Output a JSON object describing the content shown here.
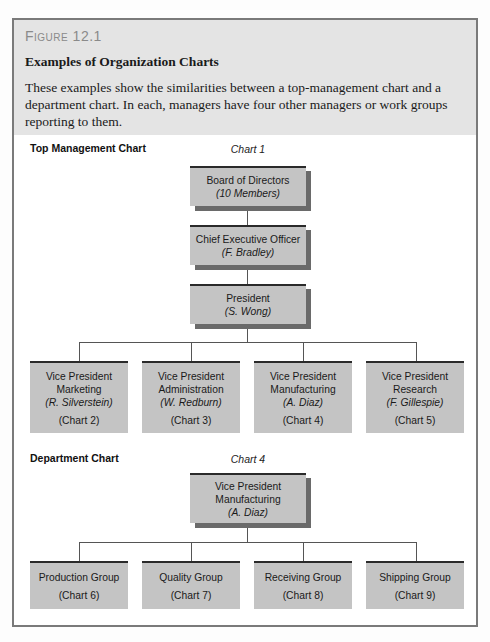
{
  "figure": {
    "label": "Figure 12.1",
    "title": "Examples of Organization Charts",
    "description": "These examples show the similarities between a top-management chart and a department chart. In each, managers have four other managers or work groups reporting to them."
  },
  "top_chart": {
    "section_label": "Top Management Chart",
    "chart_label": "Chart 1",
    "nodes": [
      {
        "title": "Board of Directors",
        "name": "(10 Members)"
      },
      {
        "title": "Chief Executive Officer",
        "name": "(F. Bradley)"
      },
      {
        "title": "President",
        "name": "(S. Wong)"
      }
    ],
    "reports": [
      {
        "title": "Vice President",
        "dept": "Marketing",
        "name": "(R. Silverstein)",
        "ref": "(Chart 2)"
      },
      {
        "title": "Vice President",
        "dept": "Administration",
        "name": "(W. Redburn)",
        "ref": "(Chart 3)"
      },
      {
        "title": "Vice President",
        "dept": "Manufacturing",
        "name": "(A. Diaz)",
        "ref": "(Chart 4)"
      },
      {
        "title": "Vice President",
        "dept": "Research",
        "name": "(F. Gillespie)",
        "ref": "(Chart 5)"
      }
    ]
  },
  "dept_chart": {
    "section_label": "Department Chart",
    "chart_label": "Chart 4",
    "head": {
      "title": "Vice President",
      "dept": "Manufacturing",
      "name": "(A. Diaz)"
    },
    "groups": [
      {
        "name": "Production Group",
        "ref": "(Chart 6)"
      },
      {
        "name": "Quality Group",
        "ref": "(Chart 7)"
      },
      {
        "name": "Receiving Group",
        "ref": "(Chart 8)"
      },
      {
        "name": "Shipping Group",
        "ref": "(Chart 9)"
      }
    ]
  }
}
